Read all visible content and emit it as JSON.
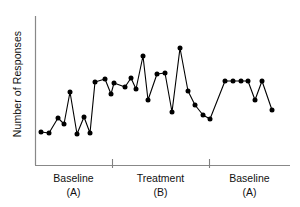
{
  "chart_data": {
    "type": "line",
    "title": "",
    "xlabel": "",
    "ylabel": "Number of Responses",
    "grid": false,
    "legend": false,
    "axis_tick_labels": false,
    "marker": "filled-circle",
    "marker_color": "#000000",
    "line_color": "#000000",
    "axis_color": "#808080",
    "xlim": [
      0,
      36
    ],
    "ylim": [
      0,
      100
    ],
    "x": [
      1,
      2,
      3,
      4,
      5,
      6,
      7,
      8,
      9,
      10,
      11,
      12,
      13,
      14,
      15,
      16,
      17,
      18,
      19,
      20,
      21,
      22,
      23,
      24,
      25,
      26,
      27,
      28,
      29,
      30,
      31,
      32,
      33,
      34,
      35
    ],
    "values": [
      18,
      18,
      40,
      31,
      62,
      17,
      38,
      17,
      57,
      62,
      46,
      38,
      64,
      59,
      76,
      45,
      66,
      67,
      39,
      88,
      56,
      47,
      36,
      62,
      62,
      62,
      62,
      49,
      62,
      41,
      17,
      18,
      40,
      31,
      62
    ],
    "series": [
      {
        "name": "Responses per session",
        "points": [
          {
            "x": 1,
            "y": 18,
            "phase": "A1"
          },
          {
            "x": 2,
            "y": 18,
            "phase": "A1"
          },
          {
            "x": 3,
            "y": 40,
            "phase": "A1"
          },
          {
            "x": 4,
            "y": 31,
            "phase": "A1"
          },
          {
            "x": 5,
            "y": 62,
            "phase": "A1"
          },
          {
            "x": 6,
            "y": 17,
            "phase": "A1"
          },
          {
            "x": 7,
            "y": 38,
            "phase": "A1"
          },
          {
            "x": 8,
            "y": 17,
            "phase": "A1"
          },
          {
            "x": 9,
            "y": 70,
            "phase": "A1"
          },
          {
            "x": 10,
            "y": 74,
            "phase": "A1"
          },
          {
            "x": 11,
            "y": 52,
            "phase": "A1"
          },
          {
            "x": 12,
            "y": 76,
            "phase": "B"
          },
          {
            "x": 13,
            "y": 70,
            "phase": "B"
          },
          {
            "x": 14,
            "y": 88,
            "phase": "B"
          },
          {
            "x": 15,
            "y": 55,
            "phase": "B"
          },
          {
            "x": 16,
            "y": 78,
            "phase": "B"
          },
          {
            "x": 17,
            "y": 79,
            "phase": "B"
          },
          {
            "x": 18,
            "y": 45,
            "phase": "B"
          },
          {
            "x": 19,
            "y": 96,
            "phase": "B"
          },
          {
            "x": 20,
            "y": 66,
            "phase": "B"
          },
          {
            "x": 21,
            "y": 56,
            "phase": "B"
          },
          {
            "x": 22,
            "y": 42,
            "phase": "B"
          },
          {
            "x": 23,
            "y": 74,
            "phase": "A2"
          },
          {
            "x": 24,
            "y": 74,
            "phase": "A2"
          },
          {
            "x": 25,
            "y": 74,
            "phase": "A2"
          },
          {
            "x": 26,
            "y": 74,
            "phase": "A2"
          },
          {
            "x": 27,
            "y": 58,
            "phase": "A2"
          },
          {
            "x": 28,
            "y": 74,
            "phase": "A2"
          },
          {
            "x": 29,
            "y": 50,
            "phase": "A2"
          }
        ]
      }
    ],
    "pixel_points": [
      [
        41,
        132
      ],
      [
        49,
        133
      ],
      [
        58,
        118
      ],
      [
        64,
        124
      ],
      [
        70,
        92
      ],
      [
        77,
        134
      ],
      [
        84,
        117
      ],
      [
        90,
        133
      ],
      [
        95,
        82
      ],
      [
        105,
        79
      ],
      [
        111,
        94
      ],
      [
        114,
        83
      ],
      [
        125,
        87
      ],
      [
        131,
        78
      ],
      [
        136,
        89
      ],
      [
        143,
        56
      ],
      [
        148,
        100
      ],
      [
        157,
        74
      ],
      [
        165,
        73
      ],
      [
        172,
        112
      ],
      [
        180,
        48
      ],
      [
        188,
        91
      ],
      [
        195,
        105
      ],
      [
        203,
        115
      ],
      [
        210,
        119
      ],
      [
        225,
        81
      ],
      [
        233,
        81
      ],
      [
        241,
        81
      ],
      [
        248,
        81
      ],
      [
        255,
        100
      ],
      [
        262,
        81
      ],
      [
        272,
        110
      ]
    ],
    "phase_dividers_px": [
      112,
      209
    ],
    "plot_box_px": {
      "left": 35,
      "right": 290,
      "top": 16,
      "bottom": 165
    },
    "annotations": [
      {
        "label": "Baseline",
        "sublabel": "(A)",
        "phase": "A1"
      },
      {
        "label": "Treatment",
        "sublabel": "(B)",
        "phase": "B"
      },
      {
        "label": "Baseline",
        "sublabel": "(A)",
        "phase": "A2"
      }
    ],
    "phases": [
      {
        "id": "A1",
        "name": "Baseline",
        "sub": "(A)",
        "width_fraction": 0.302
      },
      {
        "id": "B",
        "name": "Treatment",
        "sub": "(B)",
        "width_fraction": 0.38
      },
      {
        "id": "A2",
        "name": "Baseline",
        "sub": "(A)",
        "width_fraction": 0.318
      }
    ]
  }
}
